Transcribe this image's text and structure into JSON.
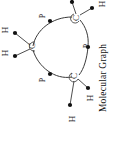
{
  "figure": {
    "caption": "Molecular Graph",
    "caption_orientation": "rotated-90-clockwise",
    "ring_atoms": [
      {
        "id": "c-left",
        "label": "C",
        "x": 33,
        "y": 46
      },
      {
        "id": "c-top",
        "label": "C",
        "x": 77,
        "y": 18
      },
      {
        "id": "c-bottom",
        "label": "C",
        "x": 75,
        "y": 76
      }
    ],
    "site_labels": [
      {
        "id": "p-upper-left",
        "label": "P",
        "x": 43,
        "y": 16
      },
      {
        "id": "p-right",
        "label": "P",
        "x": 87,
        "y": 46
      },
      {
        "id": "p-lower-left",
        "label": "P",
        "x": 43,
        "y": 80
      }
    ],
    "hydrogens": [
      {
        "id": "h-left-upper",
        "label": "H",
        "x": 6,
        "y": 30
      },
      {
        "id": "h-left-lower",
        "label": "H",
        "x": 6,
        "y": 53
      },
      {
        "id": "h-bottom-right",
        "label": "H",
        "x": 91,
        "y": 98
      },
      {
        "id": "h-bottom-low",
        "label": "H",
        "x": 73,
        "y": 119
      },
      {
        "id": "h-top-right",
        "label": "H",
        "x": 103,
        "y": 4
      }
    ],
    "colors": {
      "background": "#ffffff",
      "bond": "#3a3a3a",
      "node": "#111111",
      "text": "#1a1a1a"
    }
  }
}
